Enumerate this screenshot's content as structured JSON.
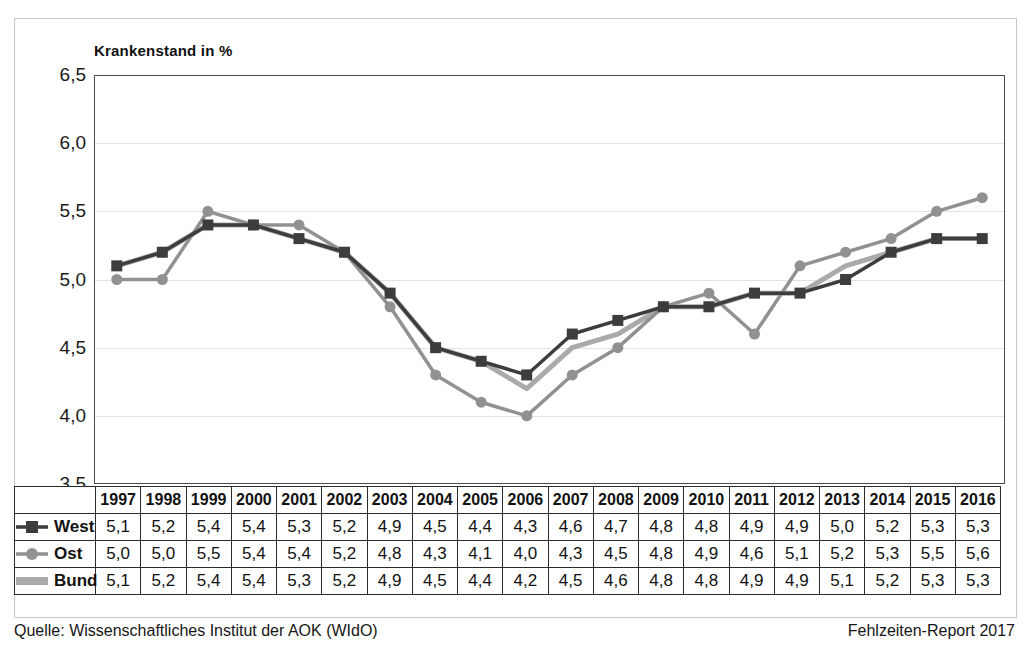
{
  "chart_data": {
    "type": "line",
    "title": "Krankenstand in %",
    "xlabel": "",
    "ylabel": "Krankenstand in %",
    "ylim": [
      3.5,
      6.5
    ],
    "ytick_labels": [
      "6,5",
      "6,0",
      "5,5",
      "5,0",
      "4,5",
      "4,0",
      "3,5"
    ],
    "ytick_values": [
      6.5,
      6.0,
      5.5,
      5.0,
      4.5,
      4.0,
      3.5
    ],
    "grid": true,
    "legend_position": "table-row-labels",
    "categories": [
      "1997",
      "1998",
      "1999",
      "2000",
      "2001",
      "2002",
      "2003",
      "2004",
      "2005",
      "2006",
      "2007",
      "2008",
      "2009",
      "2010",
      "2011",
      "2012",
      "2013",
      "2014",
      "2015",
      "2016"
    ],
    "series": [
      {
        "name": "West",
        "color": "#3d3d3d",
        "marker": "square",
        "values": [
          5.1,
          5.2,
          5.4,
          5.4,
          5.3,
          5.2,
          4.9,
          4.5,
          4.4,
          4.3,
          4.6,
          4.7,
          4.8,
          4.8,
          4.9,
          4.9,
          5.0,
          5.2,
          5.3,
          5.3
        ],
        "labels": [
          "5,1",
          "5,2",
          "5,4",
          "5,4",
          "5,3",
          "5,2",
          "4,9",
          "4,5",
          "4,4",
          "4,3",
          "4,6",
          "4,7",
          "4,8",
          "4,8",
          "4,9",
          "4,9",
          "5,0",
          "5,2",
          "5,3",
          "5,3"
        ]
      },
      {
        "name": "Ost",
        "color": "#919191",
        "marker": "circle",
        "values": [
          5.0,
          5.0,
          5.5,
          5.4,
          5.4,
          5.2,
          4.8,
          4.3,
          4.1,
          4.0,
          4.3,
          4.5,
          4.8,
          4.9,
          4.6,
          5.1,
          5.2,
          5.3,
          5.5,
          5.6
        ],
        "labels": [
          "5,0",
          "5,0",
          "5,5",
          "5,4",
          "5,4",
          "5,2",
          "4,8",
          "4,3",
          "4,1",
          "4,0",
          "4,3",
          "4,5",
          "4,8",
          "4,9",
          "4,6",
          "5,1",
          "5,2",
          "5,3",
          "5,5",
          "5,6"
        ]
      },
      {
        "name": "Bund",
        "color": "#aaaaaa",
        "marker": "none",
        "values": [
          5.1,
          5.2,
          5.4,
          5.4,
          5.3,
          5.2,
          4.9,
          4.5,
          4.4,
          4.2,
          4.5,
          4.6,
          4.8,
          4.8,
          4.9,
          4.9,
          5.1,
          5.2,
          5.3,
          5.3
        ],
        "labels": [
          "5,1",
          "5,2",
          "5,4",
          "5,4",
          "5,3",
          "5,2",
          "4,9",
          "4,5",
          "4,4",
          "4,2",
          "4,5",
          "4,6",
          "4,8",
          "4,8",
          "4,9",
          "4,9",
          "5,1",
          "5,2",
          "5,3",
          "5,3"
        ]
      }
    ]
  },
  "footer": {
    "source": "Quelle: Wissenschaftliches Institut der AOK (WIdO)",
    "report": "Fehlzeiten-Report 2017"
  },
  "colors": {
    "west": "#3d3d3d",
    "ost": "#919191",
    "bund": "#aaaaaa",
    "axis": "#4a4a4a",
    "grid": "#e2e2e6"
  }
}
